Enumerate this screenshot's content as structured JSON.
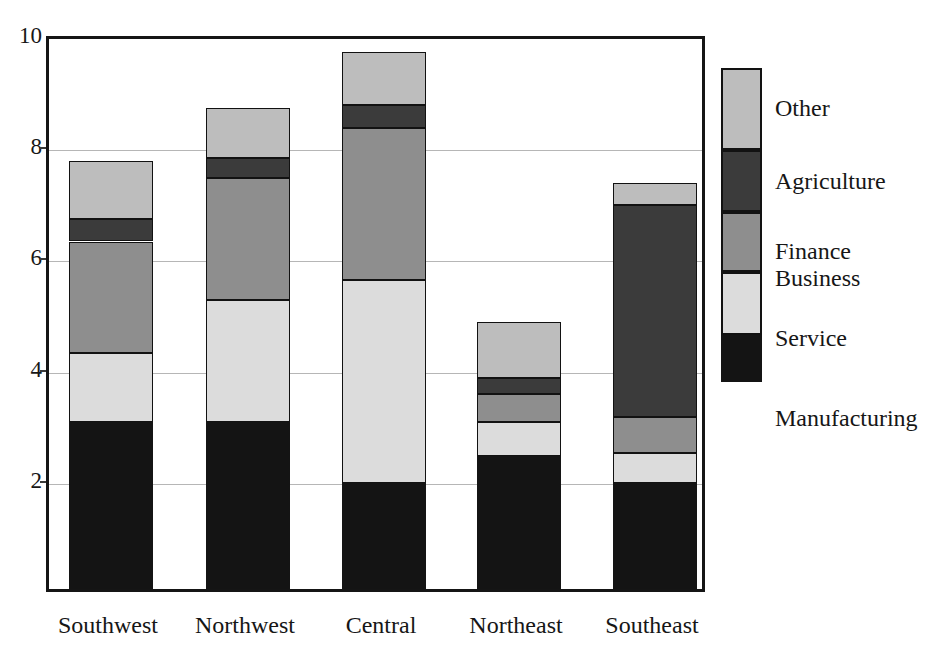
{
  "scan_artifact_text": "",
  "chart_data": {
    "type": "bar",
    "subtype": "stacked-bar",
    "title": "",
    "xlabel": "",
    "ylabel": "",
    "ylim": [
      0,
      10
    ],
    "yticks": [
      2,
      4,
      6,
      8,
      10
    ],
    "ytick_labels": [
      "2",
      "4",
      "6",
      "8",
      "10"
    ],
    "grid": true,
    "grid_axis": "y",
    "legend_position": "right",
    "legend_style": "stacked-swatch-column",
    "categories": [
      "Southwest",
      "Northwest",
      "Central",
      "Northeast",
      "Southeast"
    ],
    "stack_order_bottom_to_top": [
      "Manufacturing",
      "Service",
      "Finance Business",
      "Agriculture",
      "Other"
    ],
    "series": [
      {
        "name": "Manufacturing",
        "color": "#141414",
        "values": [
          3.0,
          3.0,
          1.9,
          2.4,
          1.9
        ]
      },
      {
        "name": "Service",
        "color": "#dcdcdc",
        "values": [
          1.25,
          2.2,
          3.65,
          0.6,
          0.55
        ]
      },
      {
        "name": "Finance Business",
        "color": "#8e8e8e",
        "values": [
          2.0,
          2.2,
          2.75,
          0.5,
          0.65
        ]
      },
      {
        "name": "Agriculture",
        "color": "#3b3b3b",
        "values": [
          0.4,
          0.35,
          0.4,
          0.3,
          3.8
        ]
      },
      {
        "name": "Other",
        "color": "#bdbdbd",
        "values": [
          1.05,
          0.9,
          0.95,
          1.0,
          0.4
        ]
      }
    ],
    "totals": [
      7.7,
      8.65,
      9.65,
      4.8,
      7.3
    ]
  },
  "legend": {
    "entries": [
      {
        "label": "Other",
        "label_line2": "",
        "key": "other"
      },
      {
        "label": "Agriculture",
        "label_line2": "",
        "key": "agriculture"
      },
      {
        "label": "Finance",
        "label_line2": "Business",
        "key": "finance"
      },
      {
        "label": "Service",
        "label_line2": "",
        "key": "service"
      },
      {
        "label": "Manufacturing",
        "label_line2": "",
        "key": "manufacturing"
      }
    ]
  }
}
